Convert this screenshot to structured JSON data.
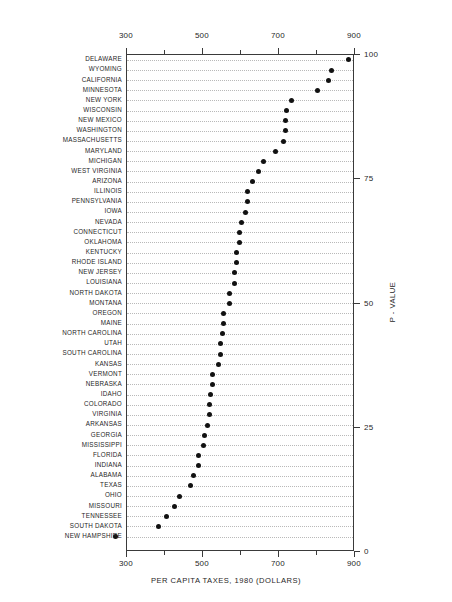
{
  "chart_data": {
    "type": "scatter",
    "title": "",
    "xlabel": "PER CAPITA TAXES, 1980 (DOLLARS)",
    "ylabel": "P - VALUE",
    "xlim": [
      300,
      900
    ],
    "ylim": [
      0,
      100
    ],
    "grid": "dotted-horizontal-rows",
    "legend": "none",
    "x_ticks_major": [
      300,
      500,
      700,
      900
    ],
    "x_ticks_minor": [
      400,
      600,
      800
    ],
    "x_tick_labels": [
      "300",
      "500",
      "700",
      "900"
    ],
    "y_ticks": [
      0,
      25,
      50,
      75,
      100
    ],
    "y_tick_labels": [
      "0",
      "25",
      "50",
      "75",
      "100"
    ],
    "categories": [
      "DELAWARE",
      "WYOMING",
      "CALIFORNIA",
      "MINNESOTA",
      "NEW YORK",
      "WISCONSIN",
      "NEW MEXICO",
      "WASHINGTON",
      "MASSACHUSETTS",
      "MARYLAND",
      "MICHIGAN",
      "WEST VIRGINIA",
      "ARIZONA",
      "ILLINOIS",
      "PENNSYLVANIA",
      "IOWA",
      "NEVADA",
      "CONNECTICUT",
      "OKLAHOMA",
      "KENTUCKY",
      "RHODE ISLAND",
      "NEW JERSEY",
      "LOUISIANA",
      "NORTH DAKOTA",
      "MONTANA",
      "OREGON",
      "MAINE",
      "NORTH CAROLINA",
      "UTAH",
      "SOUTH CAROLINA",
      "KANSAS",
      "VERMONT",
      "NEBRASKA",
      "IDAHO",
      "COLORADO",
      "VIRGINIA",
      "ARKANSAS",
      "GEORGIA",
      "MISSISSIPPI",
      "FLORIDA",
      "INDIANA",
      "ALABAMA",
      "TEXAS",
      "OHIO",
      "MISSOURI",
      "TENNESSEE",
      "SOUTH DAKOTA",
      "NEW HAMPSHIRE"
    ],
    "values": [
      882,
      837,
      831,
      800,
      732,
      721,
      718,
      718,
      713,
      692,
      658,
      645,
      629,
      618,
      618,
      613,
      600,
      597,
      595,
      589,
      589,
      584,
      582,
      571,
      571,
      555,
      555,
      550,
      545,
      545,
      542,
      524,
      524,
      521,
      518,
      516,
      511,
      505,
      500,
      489,
      489,
      474,
      468,
      439,
      424,
      403,
      382,
      271
    ],
    "p_values": [
      99,
      97,
      95,
      93,
      91,
      89,
      87,
      85,
      83,
      81,
      79,
      77,
      75,
      73,
      71,
      69,
      67,
      65,
      63,
      61,
      59,
      57,
      55,
      53,
      51,
      49,
      47,
      45,
      43,
      41,
      39,
      37,
      35,
      33,
      31,
      29,
      27,
      25,
      23,
      21,
      19,
      17,
      15,
      13,
      11,
      9,
      7,
      2
    ],
    "point_color": "#111111",
    "grid_color": "#b9b9b9",
    "axis_color": "#3a3a3a"
  }
}
